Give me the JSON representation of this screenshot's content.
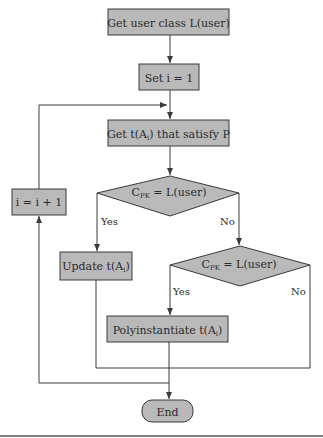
{
  "diagram": {
    "type": "flowchart",
    "nodes": {
      "get_user_class": {
        "shape": "process",
        "text": "Get user class L(user)"
      },
      "set_i": {
        "shape": "process",
        "text": "Set i = 1"
      },
      "get_t": {
        "shape": "process",
        "text_pre": "Get t(A",
        "text_sub": "i",
        "text_post": ") that satisfy P"
      },
      "decision1": {
        "shape": "decision",
        "text_pre": "C",
        "text_sub": "PK",
        "text_post": " = L(user)"
      },
      "update_t": {
        "shape": "process",
        "text_pre": "Update t(A",
        "text_sub": "i",
        "text_post": ")"
      },
      "increment_i": {
        "shape": "process",
        "text": "i = i + 1"
      },
      "decision2": {
        "shape": "decision",
        "text_pre": "C",
        "text_sub": "PK",
        "text_post": " = L(user)"
      },
      "polyinstantiate": {
        "shape": "process",
        "text_pre": "Polyinstantiate t(A",
        "text_sub": "i",
        "text_post": ")"
      },
      "end": {
        "shape": "terminator",
        "text": "End"
      }
    },
    "edge_labels": {
      "d1_yes": "Yes",
      "d1_no": "No",
      "d2_yes": "Yes",
      "d2_no": "No"
    },
    "edges": [
      {
        "from": "get_user_class",
        "to": "set_i"
      },
      {
        "from": "set_i",
        "to": "get_t"
      },
      {
        "from": "get_t",
        "to": "decision1"
      },
      {
        "from": "decision1",
        "to": "update_t",
        "label": "Yes"
      },
      {
        "from": "decision1",
        "to": "decision2",
        "label": "No"
      },
      {
        "from": "decision2",
        "to": "polyinstantiate",
        "label": "Yes"
      },
      {
        "from": "decision2",
        "to": "end",
        "label": "No"
      },
      {
        "from": "update_t",
        "to": "end"
      },
      {
        "from": "polyinstantiate",
        "to": "end"
      },
      {
        "from": "end_path",
        "to": "increment_i"
      },
      {
        "from": "increment_i",
        "to": "get_t"
      }
    ],
    "colors": {
      "node_fill": "#b9b9b9",
      "line": "#3a3a3a",
      "text": "#2b2b2b"
    }
  }
}
